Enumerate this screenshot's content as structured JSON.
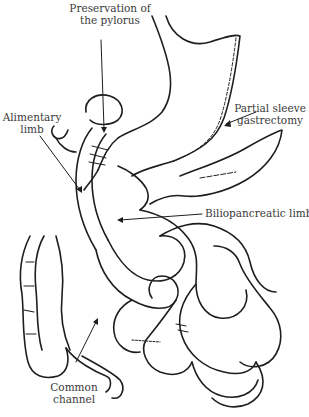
{
  "diagram": {
    "type": "surgical-anatomy-line-drawing",
    "colors": {
      "stroke": "#1e1e1e",
      "label_text": "#3a3a3a",
      "background": "#ffffff"
    },
    "labels": [
      {
        "id": "pylorus",
        "lines": [
          "Preservation of",
          "the pylorus"
        ]
      },
      {
        "id": "sleeve",
        "lines": [
          "Partial sleeve",
          "gastrectomy"
        ]
      },
      {
        "id": "alimentary",
        "lines": [
          "Alimentary",
          "limb"
        ]
      },
      {
        "id": "biliopancreatic",
        "lines": [
          "Biliopancreatic limb"
        ]
      },
      {
        "id": "common",
        "lines": [
          "Common",
          "channel"
        ]
      }
    ]
  }
}
